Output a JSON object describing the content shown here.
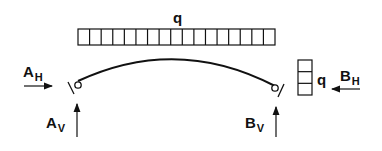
{
  "diagram": {
    "type": "three-hinged-arch-free-body",
    "top_load": {
      "label": "q",
      "cells": 17
    },
    "side_load": {
      "label": "q",
      "cells": 3
    },
    "reactions": {
      "A_H": {
        "main": "A",
        "sub": "H"
      },
      "A_V": {
        "main": "A",
        "sub": "V"
      },
      "B_H": {
        "main": "B",
        "sub": "H"
      },
      "B_V": {
        "main": "B",
        "sub": "V"
      }
    },
    "colors": {
      "stroke": "#111111",
      "background": "#ffffff"
    }
  }
}
